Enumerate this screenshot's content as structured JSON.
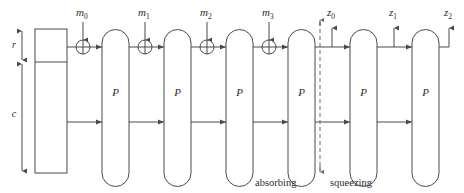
{
  "diagram": {
    "colors": {
      "stroke": "#4a4a4a",
      "dashed": "#6a6a6a",
      "text": "#2b2b2b",
      "background": "#ffffff"
    },
    "axis_labels": {
      "rate": "r",
      "capacity": "c"
    },
    "message_blocks": [
      {
        "base": "m",
        "sub": "0"
      },
      {
        "base": "m",
        "sub": "1"
      },
      {
        "base": "m",
        "sub": "2"
      },
      {
        "base": "m",
        "sub": "3"
      }
    ],
    "output_blocks": [
      {
        "base": "z",
        "sub": "0"
      },
      {
        "base": "z",
        "sub": "1"
      },
      {
        "base": "z",
        "sub": "2"
      }
    ],
    "permutations": [
      {
        "label": "P"
      },
      {
        "label": "P"
      },
      {
        "label": "P"
      },
      {
        "label": "P"
      },
      {
        "label": "P"
      },
      {
        "label": "P"
      }
    ],
    "phases": {
      "absorbing": "absorbing",
      "squeezing": "squeezing"
    },
    "xor_symbol": "plus-in-circle",
    "permutation_count": 6,
    "absorbing_permutation_count": 4,
    "squeezing_permutation_count": 2
  }
}
